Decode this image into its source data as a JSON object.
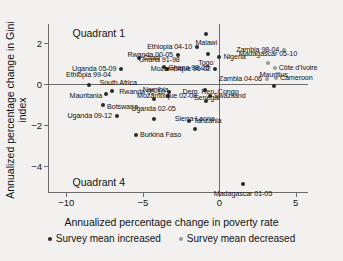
{
  "chart_data": {
    "type": "scatter",
    "title": "",
    "xlabel": "Annualized percentage change in poverty rate",
    "ylabel": "Annualized percentage change in Gini index",
    "xlim": [
      -11.2,
      5.8
    ],
    "ylim": [
      -5.3,
      2.9
    ],
    "xticks": [
      -10,
      -5,
      0,
      5
    ],
    "xticklabels": [
      "−10",
      "−5",
      "0",
      "5"
    ],
    "yticks": [
      2,
      0,
      -2,
      -4
    ],
    "yticklabels": [
      "2",
      "0",
      "−2",
      "−4"
    ],
    "grid": false,
    "reference_lines": {
      "x": 0,
      "y": 0
    },
    "annotations": [
      {
        "text": "Quadrant 1",
        "x": -9.6,
        "y": 2.45
      },
      {
        "text": "Quadrant 4",
        "x": -9.6,
        "y": -4.75
      }
    ],
    "legend": {
      "position": "bottom",
      "entries": [
        {
          "label": "Survey mean increased",
          "key": "inc",
          "color": "#2b2b2b"
        },
        {
          "label": "Survey mean decreased",
          "key": "dec",
          "color": "#9a9a9a"
        }
      ]
    },
    "points": [
      {
        "label": "Malawi",
        "x": -0.85,
        "y": 2.42,
        "series": "inc",
        "lpos": "c",
        "ldx": 0,
        "ldy": 9
      },
      {
        "label": "Ethiopia 04-10",
        "x": -1.45,
        "y": 1.78,
        "series": "inc",
        "lpos": "r",
        "ldx": -5,
        "ldy": 0
      },
      {
        "label": "Togo",
        "x": -0.75,
        "y": 1.45,
        "series": "inc",
        "lpos": "c",
        "ldx": -2,
        "ldy": 9
      },
      {
        "label": "Nigeria",
        "x": -0.05,
        "y": 1.32,
        "series": "inc",
        "lpos": "l",
        "ldx": 5,
        "ldy": 0
      },
      {
        "label": "Zambia 98-04",
        "x": 4.25,
        "y": 1.62,
        "series": "dec",
        "lpos": "r",
        "ldx": -5,
        "ldy": 0
      },
      {
        "label": "Madagascar 05-10",
        "x": 3.18,
        "y": 1.0,
        "series": "dec",
        "lpos": "c",
        "ldx": 0,
        "ldy": -9
      },
      {
        "label": "Côte d'Ivoire",
        "x": 3.62,
        "y": 0.78,
        "series": "dec",
        "lpos": "l",
        "ldx": 4,
        "ldy": 0
      },
      {
        "label": "Cameroon",
        "x": 3.7,
        "y": 0.3,
        "series": "dec",
        "lpos": "l",
        "ldx": 4,
        "ldy": 0
      },
      {
        "label": "Zambia 04-06",
        "x": 3.12,
        "y": 0.22,
        "series": "dec",
        "lpos": "r",
        "ldx": -5,
        "ldy": 0
      },
      {
        "label": "Mauritius",
        "x": 3.55,
        "y": -0.1,
        "series": "inc",
        "lpos": "c",
        "ldx": 0,
        "ldy": -11
      },
      {
        "label": "Rwanda 00-05",
        "x": -2.7,
        "y": 1.42,
        "series": "inc",
        "lpos": "r",
        "ldx": -5,
        "ldy": 0
      },
      {
        "label": "Chad",
        "x": -5.25,
        "y": 1.25,
        "series": "inc",
        "lpos": "l",
        "ldx": 4,
        "ldy": 0
      },
      {
        "label": "Ghana 98-05",
        "x": -3.6,
        "y": 0.82,
        "series": "inc",
        "lpos": "l",
        "ldx": 4,
        "ldy": 1
      },
      {
        "label": "Ghana 91-98",
        "x": -3.4,
        "y": 0.72,
        "series": "inc",
        "lpos": "c",
        "ldx": -8,
        "ldy": -9
      },
      {
        "label": "Mozambique 96-02",
        "x": -0.3,
        "y": 0.7,
        "series": "inc",
        "lpos": "r",
        "ldx": -4,
        "ldy": 0
      },
      {
        "label": "Uganda 05-09",
        "x": -6.4,
        "y": 0.7,
        "series": "inc",
        "lpos": "r",
        "ldx": -5,
        "ldy": 0
      },
      {
        "label": "Ethiopia 99-04",
        "x": -8.55,
        "y": -0.05,
        "series": "inc",
        "lpos": "c",
        "ldx": 0,
        "ldy": -10
      },
      {
        "label": "South Africa",
        "x": -7.0,
        "y": -0.35,
        "series": "inc",
        "lpos": "c",
        "ldx": 6,
        "ldy": -8
      },
      {
        "label": "Mauritania",
        "x": -7.4,
        "y": -0.52,
        "series": "inc",
        "lpos": "r",
        "ldx": -4,
        "ldy": 2
      },
      {
        "label": "Botswana",
        "x": -7.6,
        "y": -1.05,
        "series": "inc",
        "lpos": "l",
        "ldx": 4,
        "ldy": 2
      },
      {
        "label": "Rwanda 05-10",
        "x": -3.3,
        "y": -0.38,
        "series": "inc",
        "lpos": "r",
        "ldx": -4,
        "ldy": 0
      },
      {
        "label": "Mozambique 02-08",
        "x": -3.35,
        "y": -0.58,
        "series": "inc",
        "lpos": "l",
        "ldx": -31,
        "ldy": 0
      },
      {
        "label": "Namibia",
        "x": -4.3,
        "y": -0.72,
        "series": "inc",
        "lpos": "c",
        "ldx": 2,
        "ldy": -9
      },
      {
        "label": "Senegal",
        "x": -0.95,
        "y": -0.3,
        "series": "inc",
        "lpos": "c",
        "ldx": 2,
        "ldy": 8
      },
      {
        "label": "Swaziland",
        "x": -0.62,
        "y": -0.58,
        "series": "inc",
        "lpos": "l",
        "ldx": 4,
        "ldy": 0
      },
      {
        "label": "Dem. Rep. Congo",
        "x": -0.9,
        "y": -0.82,
        "series": "inc",
        "lpos": "c",
        "ldx": 5,
        "ldy": -9
      },
      {
        "label": "Uganda 09-12",
        "x": -6.7,
        "y": -1.55,
        "series": "inc",
        "lpos": "r",
        "ldx": -5,
        "ldy": 0
      },
      {
        "label": "Uganda 02-05",
        "x": -4.3,
        "y": -1.72,
        "series": "inc",
        "lpos": "c",
        "ldx": 0,
        "ldy": -10
      },
      {
        "label": "Tanzania",
        "x": -1.95,
        "y": -1.8,
        "series": "inc",
        "lpos": "l",
        "ldx": 4,
        "ldy": 0
      },
      {
        "label": "Sierra Leone",
        "x": -1.6,
        "y": -2.2,
        "series": "inc",
        "lpos": "c",
        "ldx": 0,
        "ldy": -10
      },
      {
        "label": "Burkina Faso",
        "x": -5.45,
        "y": -2.5,
        "series": "inc",
        "lpos": "l",
        "ldx": 4,
        "ldy": 0
      },
      {
        "label": "Madagascar 01-05",
        "x": 1.55,
        "y": -4.85,
        "series": "inc",
        "lpos": "c",
        "ldx": 0,
        "ldy": 10
      }
    ]
  }
}
